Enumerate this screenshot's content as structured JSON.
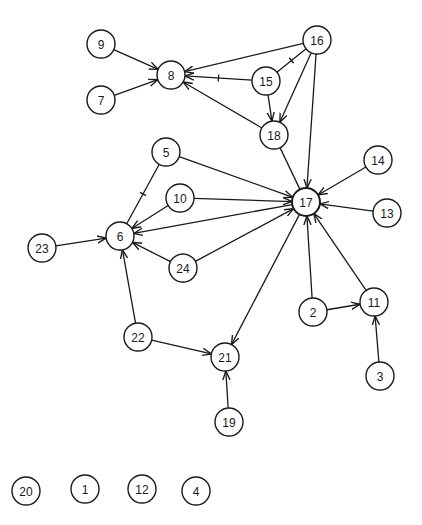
{
  "diagram": {
    "type": "directed-graph",
    "node_radius": 14,
    "colors": {
      "stroke": "#1a1a1a",
      "fill": "#ffffff",
      "background": "#ffffff"
    },
    "nodes": [
      {
        "id": "9",
        "label": "9",
        "x": 101,
        "y": 44
      },
      {
        "id": "8",
        "label": "8",
        "x": 171,
        "y": 75
      },
      {
        "id": "7",
        "label": "7",
        "x": 101,
        "y": 100
      },
      {
        "id": "16",
        "label": "16",
        "x": 317,
        "y": 40
      },
      {
        "id": "15",
        "label": "15",
        "x": 266,
        "y": 81
      },
      {
        "id": "18",
        "label": "18",
        "x": 274,
        "y": 135
      },
      {
        "id": "5",
        "label": "5",
        "x": 166,
        "y": 152
      },
      {
        "id": "10",
        "label": "10",
        "x": 180,
        "y": 198
      },
      {
        "id": "17",
        "label": "17",
        "x": 306,
        "y": 202,
        "hub": true
      },
      {
        "id": "14",
        "label": "14",
        "x": 378,
        "y": 160
      },
      {
        "id": "13",
        "label": "13",
        "x": 387,
        "y": 213
      },
      {
        "id": "23",
        "label": "23",
        "x": 42,
        "y": 248
      },
      {
        "id": "6",
        "label": "6",
        "x": 120,
        "y": 236
      },
      {
        "id": "24",
        "label": "24",
        "x": 183,
        "y": 268
      },
      {
        "id": "2",
        "label": "2",
        "x": 313,
        "y": 312
      },
      {
        "id": "11",
        "label": "11",
        "x": 374,
        "y": 302
      },
      {
        "id": "22",
        "label": "22",
        "x": 138,
        "y": 337
      },
      {
        "id": "21",
        "label": "21",
        "x": 225,
        "y": 357
      },
      {
        "id": "3",
        "label": "3",
        "x": 380,
        "y": 376
      },
      {
        "id": "19",
        "label": "19",
        "x": 229,
        "y": 422
      },
      {
        "id": "20",
        "label": "20",
        "x": 26,
        "y": 491
      },
      {
        "id": "1",
        "label": "1",
        "x": 85,
        "y": 489
      },
      {
        "id": "12",
        "label": "12",
        "x": 142,
        "y": 489
      },
      {
        "id": "4",
        "label": "4",
        "x": 196,
        "y": 491
      }
    ],
    "edges": [
      {
        "from": "9",
        "to": "8",
        "arrow": true
      },
      {
        "from": "7",
        "to": "8",
        "arrow": true
      },
      {
        "from": "16",
        "to": "8",
        "arrow": true
      },
      {
        "from": "15",
        "to": "8",
        "arrow": true,
        "tick": true
      },
      {
        "from": "18",
        "to": "8",
        "arrow": true
      },
      {
        "from": "16",
        "to": "15",
        "arrow": false,
        "tick": true
      },
      {
        "from": "15",
        "to": "18",
        "arrow": true
      },
      {
        "from": "16",
        "to": "18",
        "arrow": true
      },
      {
        "from": "16",
        "to": "17",
        "arrow": true
      },
      {
        "from": "18",
        "to": "17",
        "arrow": false
      },
      {
        "from": "5",
        "to": "17",
        "arrow": true
      },
      {
        "from": "5",
        "to": "6",
        "arrow": false,
        "tick": true
      },
      {
        "from": "10",
        "to": "6",
        "arrow": true
      },
      {
        "from": "10",
        "to": "17",
        "arrow": true
      },
      {
        "from": "17",
        "to": "6",
        "arrow": true
      },
      {
        "from": "24",
        "to": "6",
        "arrow": true
      },
      {
        "from": "24",
        "to": "17",
        "arrow": true
      },
      {
        "from": "23",
        "to": "6",
        "arrow": true
      },
      {
        "from": "14",
        "to": "17",
        "arrow": true
      },
      {
        "from": "13",
        "to": "17",
        "arrow": true
      },
      {
        "from": "2",
        "to": "17",
        "arrow": true
      },
      {
        "from": "11",
        "to": "17",
        "arrow": true
      },
      {
        "from": "2",
        "to": "11",
        "arrow": true
      },
      {
        "from": "3",
        "to": "11",
        "arrow": true
      },
      {
        "from": "17",
        "to": "21",
        "arrow": true
      },
      {
        "from": "22",
        "to": "6",
        "arrow": true
      },
      {
        "from": "22",
        "to": "21",
        "arrow": true
      },
      {
        "from": "19",
        "to": "21",
        "arrow": true
      }
    ]
  }
}
